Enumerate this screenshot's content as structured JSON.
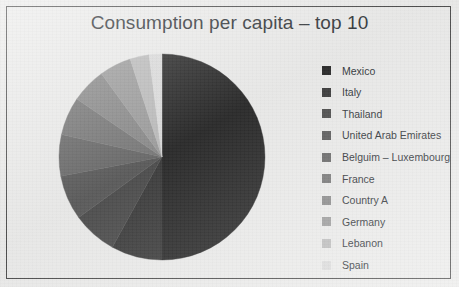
{
  "chart_data": {
    "type": "pie",
    "title": "Consumption per capita – top 10",
    "xlabel": "",
    "ylabel": "",
    "legend_position": "right",
    "grid": false,
    "categories": [
      "Mexico",
      "Italy",
      "Thailand",
      "United Arab Emirates",
      "Belguim – Luxembourg",
      "France",
      "Country A",
      "Germany",
      "Lebanon",
      "Spain"
    ],
    "values": [
      50,
      8,
      7,
      7,
      6.5,
      6,
      5.5,
      5,
      3,
      2
    ],
    "slice_colors": [
      "#2b2b2b",
      "#3d3d3d",
      "#4e4e4e",
      "#5c5c5c",
      "#6b6b6b",
      "#7a7a7a",
      "#8c8c8c",
      "#9e9e9e",
      "#bdbdbd",
      "#dcdcdc"
    ],
    "start_angle_deg": 0,
    "direction": "clockwise"
  },
  "figure": {
    "border_color": "#4a4a4a",
    "background_color": "#ececeb"
  },
  "legend": {
    "items": [
      {
        "label": "Mexico",
        "color": "#2b2b2b"
      },
      {
        "label": "Italy",
        "color": "#3d3d3d"
      },
      {
        "label": "Thailand",
        "color": "#4e4e4e"
      },
      {
        "label": "United Arab Emirates",
        "color": "#5c5c5c"
      },
      {
        "label": "Belguim – Luxembourg",
        "color": "#6b6b6b"
      },
      {
        "label": "France",
        "color": "#7a7a7a"
      },
      {
        "label": "Country A",
        "color": "#8c8c8c"
      },
      {
        "label": "Germany",
        "color": "#9e9e9e"
      },
      {
        "label": "Lebanon",
        "color": "#bdbdbd"
      },
      {
        "label": "Spain",
        "color": "#dcdcdc"
      }
    ]
  }
}
